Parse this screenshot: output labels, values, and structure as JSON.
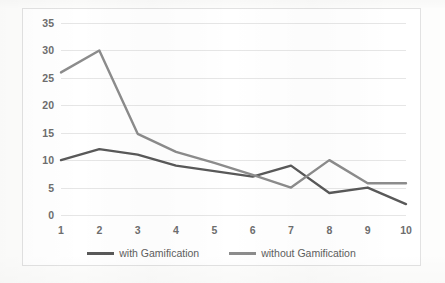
{
  "chart_data": {
    "type": "line",
    "title": "",
    "subtitle": "",
    "xlabel": "",
    "ylabel": "",
    "categories": [
      "1",
      "2",
      "3",
      "4",
      "5",
      "6",
      "7",
      "8",
      "9",
      "10"
    ],
    "x": [
      1,
      2,
      3,
      4,
      5,
      6,
      7,
      8,
      9,
      10
    ],
    "series": [
      {
        "name": "with Gamification",
        "color": "#595959",
        "values": [
          10,
          12,
          11,
          9,
          8,
          7,
          9,
          4,
          5,
          2
        ]
      },
      {
        "name": "without Gamification",
        "color": "#8c8c8c",
        "values": [
          26,
          30,
          14.8,
          11.5,
          9.5,
          7.3,
          5,
          10,
          5.8,
          5.8
        ]
      }
    ],
    "ylim": [
      0,
      35
    ],
    "xlim": [
      1,
      10
    ],
    "y_ticks": [
      "0",
      "5",
      "10",
      "15",
      "20",
      "25",
      "30",
      "35"
    ],
    "y_tick_values": [
      0,
      5,
      10,
      15,
      20,
      25,
      30,
      35
    ],
    "grid": {
      "horizontal": true,
      "vertical": false,
      "color": "#e6e6e6"
    },
    "legend": {
      "position": "bottom",
      "entries": [
        {
          "label": "with Gamification",
          "color": "#595959"
        },
        {
          "label": "without Gamification",
          "color": "#8c8c8c"
        }
      ]
    },
    "plot_border_color": "#e2e2e2",
    "background_color": "#ffffff",
    "tick_label_color": "#6e6e6e"
  }
}
